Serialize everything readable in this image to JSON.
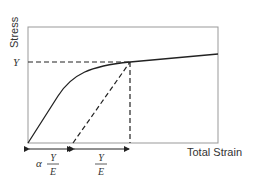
{
  "diagram": {
    "y_axis_label": "Stress",
    "x_axis_label": "Total Strain",
    "yield_label": "Y",
    "dim1": {
      "prefix": "α",
      "num": "Y",
      "den": "E"
    },
    "dim2": {
      "num": "Y",
      "den": "E"
    },
    "colors": {
      "line": "#222222",
      "frame": "#888888"
    }
  }
}
